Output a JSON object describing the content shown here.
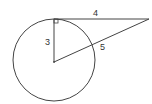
{
  "diagram": {
    "type": "circle-tangent-secant",
    "labels": {
      "tangent_length": "4",
      "radius": "3",
      "hypotenuse_segment": "5"
    },
    "right_angle_marker": true,
    "colors": {
      "stroke": "#444444",
      "background": "#ffffff"
    }
  }
}
